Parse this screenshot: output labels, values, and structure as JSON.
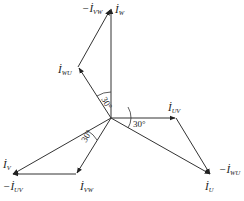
{
  "diagram": {
    "type": "phasor-diagram",
    "origin": {
      "x": 111,
      "y": 118
    },
    "vectors": [
      {
        "id": "I_W",
        "label": "İ",
        "sub": "W",
        "from": [
          111,
          118
        ],
        "to": [
          111,
          8
        ]
      },
      {
        "id": "I_WU",
        "label": "İ",
        "sub": "WU",
        "from": [
          111,
          118
        ],
        "to": [
          78,
          67
        ]
      },
      {
        "id": "neg_I_VW",
        "label": "−İ",
        "sub": "VW",
        "from": [
          78,
          67
        ],
        "to": [
          111,
          8
        ]
      },
      {
        "id": "I_UV",
        "label": "İ",
        "sub": "UV",
        "from": [
          111,
          118
        ],
        "to": [
          176,
          118
        ]
      },
      {
        "id": "neg_I_WU",
        "label": "−İ",
        "sub": "WU",
        "from": [
          176,
          118
        ],
        "to": [
          211,
          175
        ]
      },
      {
        "id": "I_U",
        "label": "İ",
        "sub": "U",
        "from": [
          111,
          118
        ],
        "to": [
          211,
          175
        ]
      },
      {
        "id": "I_VW",
        "label": "İ",
        "sub": "VW",
        "from": [
          111,
          118
        ],
        "to": [
          76,
          174
        ]
      },
      {
        "id": "neg_I_UV",
        "label": "−İ",
        "sub": "UV",
        "from": [
          76,
          174
        ],
        "to": [
          12,
          174
        ]
      },
      {
        "id": "I_V",
        "label": "İ",
        "sub": "V",
        "from": [
          111,
          118
        ],
        "to": [
          12,
          174
        ]
      }
    ],
    "labels": {
      "neg_i_vw": {
        "main": "−İ",
        "sub": "VW"
      },
      "i_w": {
        "main": "İ",
        "sub": "W"
      },
      "i_wu": {
        "main": "İ",
        "sub": "WU"
      },
      "i_uv": {
        "main": "İ",
        "sub": "UV"
      },
      "neg_i_wu": {
        "main": "−İ",
        "sub": "WU"
      },
      "i_u": {
        "main": "İ",
        "sub": "U"
      },
      "i_v": {
        "main": "İ",
        "sub": "V"
      },
      "neg_i_uv": {
        "main": "−İ",
        "sub": "UV"
      },
      "i_vw": {
        "main": "İ",
        "sub": "VW"
      }
    },
    "angles": {
      "top": "30°",
      "right": "30°",
      "lower_left": "30°"
    }
  }
}
